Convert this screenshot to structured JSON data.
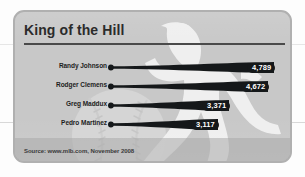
{
  "card": {
    "title": "King of the Hill",
    "source": "Source: www.mlb.com, November 2008",
    "background_color": "#c8c8c8",
    "border_color": "#b0b0b0",
    "title_color": "#2b2b2b",
    "bar_color": "#15181a",
    "value_text_color": "#ffffff"
  },
  "art": {
    "pitcher_silhouette": "pitcher-silhouette",
    "baseball": "baseball-graphic"
  },
  "chart_data": {
    "type": "bar",
    "title": "King of the Hill",
    "subtitle": "",
    "xlabel": "",
    "ylabel": "",
    "orientation": "horizontal",
    "grid": false,
    "legend": false,
    "xlim": [
      0,
      5000
    ],
    "categories": [
      "Randy Johnson",
      "Rodger Clemens",
      "Greg Maddux",
      "Pedro Martinez"
    ],
    "values": [
      4789,
      4672,
      3371,
      3117
    ],
    "value_labels": [
      "4,789",
      "4,672",
      "3,371",
      "3,117"
    ],
    "annotation": "Source: www.mlb.com, November 2008",
    "bars": [
      {
        "label": "Randy Johnson",
        "value": 4789,
        "value_label": "4,789",
        "length_px": 166
      },
      {
        "label": "Rodger Clemens",
        "value": 4672,
        "value_label": "4,672",
        "length_px": 160
      },
      {
        "label": "Greg Maddux",
        "value": 3371,
        "value_label": "3,371",
        "length_px": 121
      },
      {
        "label": "Pedro Martinez",
        "value": 3117,
        "value_label": "3,117",
        "length_px": 110
      }
    ]
  }
}
